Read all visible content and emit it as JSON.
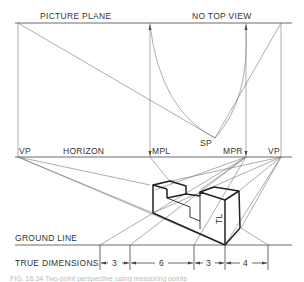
{
  "diagram": {
    "labels": {
      "picture_plane": "PICTURE PLANE",
      "no_top_view": "NO TOP VIEW",
      "vp_left": "VP",
      "horizon": "HORIZON",
      "mpl": "MPL",
      "sp": "SP",
      "mpr": "MPR",
      "vp_right": "VP",
      "true_length": "TL",
      "ground_line": "GROUND LINE",
      "true_dimensions": "TRUE DIMENSIONS"
    },
    "dimensions": [
      {
        "label": "3",
        "value": 3
      },
      {
        "label": "6",
        "value": 6
      },
      {
        "label": "3",
        "value": 3
      },
      {
        "label": "4",
        "value": 4
      }
    ],
    "caption": "FIG. 18.34  Two-point perspective using measuring points"
  }
}
